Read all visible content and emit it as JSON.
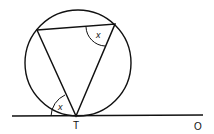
{
  "diagram": {
    "labels": {
      "tangent_point": "T",
      "line_end": "O",
      "angle_chord_tangent": "x",
      "angle_inscribed": "x"
    },
    "colors": {
      "stroke": "#111111",
      "background": "#ffffff"
    }
  }
}
